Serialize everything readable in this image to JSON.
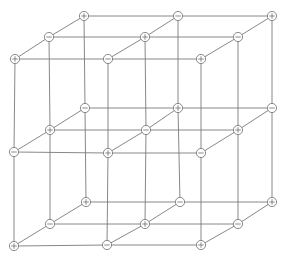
{
  "diagram": {
    "type": "crystal-lattice",
    "colors": {
      "line": "#7a7a7a",
      "ion_stroke": "#6e6e6e",
      "ion_fill": "#ffffff",
      "background": "#ffffff"
    },
    "ion_radius": 4.6,
    "layers": [
      {
        "name": "top",
        "rows": [
          {
            "depth": "back",
            "ions": [
              {
                "x": 84,
                "y": 16,
                "sign": "+"
              },
              {
                "x": 178,
                "y": 16,
                "sign": "-"
              },
              {
                "x": 272,
                "y": 16,
                "sign": "+"
              }
            ]
          },
          {
            "depth": "mid",
            "ions": [
              {
                "x": 49,
                "y": 37,
                "sign": "-"
              },
              {
                "x": 145,
                "y": 37,
                "sign": "+"
              },
              {
                "x": 238,
                "y": 37,
                "sign": "-"
              }
            ]
          },
          {
            "depth": "front",
            "ions": [
              {
                "x": 15,
                "y": 59,
                "sign": "+"
              },
              {
                "x": 108,
                "y": 59,
                "sign": "-"
              },
              {
                "x": 201,
                "y": 59,
                "sign": "+"
              }
            ]
          }
        ]
      },
      {
        "name": "middle",
        "rows": [
          {
            "depth": "back",
            "ions": [
              {
                "x": 85,
                "y": 108,
                "sign": "-"
              },
              {
                "x": 178,
                "y": 108,
                "sign": "+"
              },
              {
                "x": 272,
                "y": 108,
                "sign": "-"
              }
            ]
          },
          {
            "depth": "mid",
            "ions": [
              {
                "x": 50,
                "y": 130,
                "sign": "+"
              },
              {
                "x": 146,
                "y": 130,
                "sign": "-"
              },
              {
                "x": 238,
                "y": 130,
                "sign": "+"
              }
            ]
          },
          {
            "depth": "front",
            "ions": [
              {
                "x": 14,
                "y": 152,
                "sign": "-"
              },
              {
                "x": 108,
                "y": 153,
                "sign": "+"
              },
              {
                "x": 201,
                "y": 153,
                "sign": "-"
              }
            ]
          }
        ]
      },
      {
        "name": "bottom",
        "rows": [
          {
            "depth": "back",
            "ions": [
              {
                "x": 86,
                "y": 202,
                "sign": "+"
              },
              {
                "x": 180,
                "y": 202,
                "sign": "-"
              },
              {
                "x": 272,
                "y": 202,
                "sign": "+"
              }
            ]
          },
          {
            "depth": "mid",
            "ions": [
              {
                "x": 50,
                "y": 224,
                "sign": "-"
              },
              {
                "x": 145,
                "y": 224,
                "sign": "+"
              },
              {
                "x": 238,
                "y": 224,
                "sign": "-"
              }
            ]
          },
          {
            "depth": "front",
            "ions": [
              {
                "x": 14,
                "y": 246,
                "sign": "+"
              },
              {
                "x": 107,
                "y": 245,
                "sign": "-"
              },
              {
                "x": 201,
                "y": 245,
                "sign": "+"
              }
            ]
          }
        ]
      }
    ]
  }
}
